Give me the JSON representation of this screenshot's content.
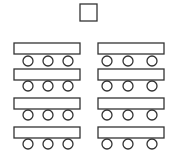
{
  "diagram": {
    "type": "classroom-seating-layout",
    "stroke_color": "#333333",
    "fill_color": "#ffffff",
    "teacher_desk": {
      "x": 80,
      "y": 4,
      "w": 17,
      "h": 17
    },
    "table_size": {
      "w": 66,
      "h": 11
    },
    "seat_radius": 5,
    "columns": [
      {
        "table_x": 14,
        "seat_x": [
          28,
          48,
          68
        ]
      },
      {
        "table_x": 98,
        "seat_x": [
          107,
          128,
          152
        ]
      }
    ],
    "rows": [
      {
        "table_y": 43,
        "seat_y": 61
      },
      {
        "table_y": 69,
        "seat_y": 86
      },
      {
        "table_y": 98,
        "seat_y": 115
      },
      {
        "table_y": 127,
        "seat_y": 144
      }
    ],
    "counts": {
      "tables": 8,
      "seats_per_table": 3,
      "total_seats": 24
    }
  }
}
